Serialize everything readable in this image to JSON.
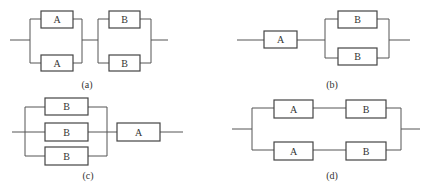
{
  "diagrams": [
    {
      "id": "a",
      "caption": "(a)",
      "description": "Two parallel A blocks in series with two parallel B blocks",
      "blocks": [
        "A",
        "A",
        "B",
        "B"
      ]
    },
    {
      "id": "b",
      "caption": "(b)",
      "description": "Single A block in series with two parallel B blocks",
      "blocks": [
        "A",
        "B",
        "B"
      ]
    },
    {
      "id": "c",
      "caption": "(c)",
      "description": "Three parallel B blocks in series with a single A block",
      "blocks": [
        "B",
        "B",
        "B",
        "A"
      ]
    },
    {
      "id": "d",
      "caption": "(d)",
      "description": "Two parallel branches, each with A in series with B",
      "blocks": [
        "A",
        "B",
        "A",
        "B"
      ]
    }
  ],
  "colors": {
    "line": "#555555",
    "box_border": "#444444",
    "text": "#333333",
    "background": "#ffffff"
  }
}
